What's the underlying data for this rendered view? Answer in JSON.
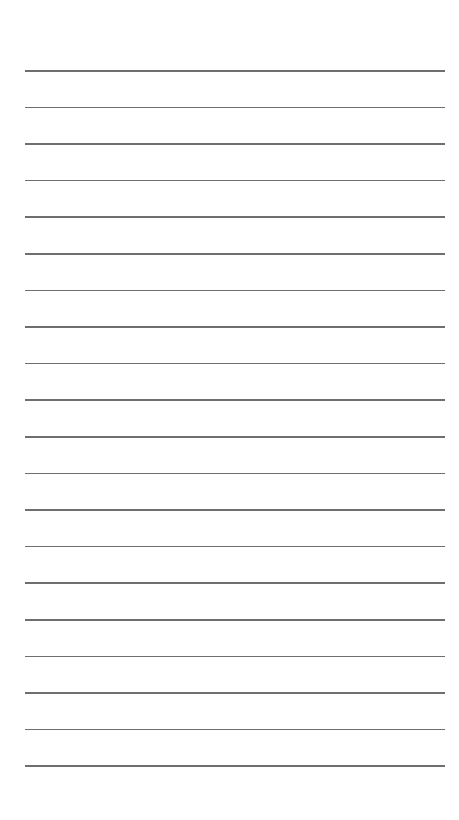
{
  "page": {
    "type": "lined-paper",
    "background": "#ffffff",
    "line_color": "#6f6f6f",
    "line_count": 20,
    "line_left": 25,
    "line_width": 420,
    "first_line_y": 70,
    "line_spacing": 36.6,
    "text": []
  }
}
